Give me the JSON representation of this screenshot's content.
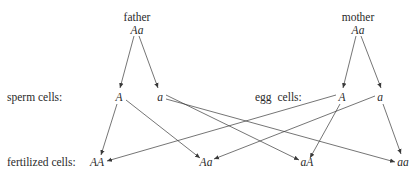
{
  "parents": {
    "father": {
      "label": "father",
      "genotype": "Aa"
    },
    "mother": {
      "label": "mother",
      "genotype": "Aa"
    }
  },
  "rows": {
    "sperm_label": "sperm cells:",
    "egg_label": "egg cells:",
    "fertilized_label": "fertilized cells:"
  },
  "gametes": {
    "sperm": [
      "A",
      "a"
    ],
    "egg": [
      "A",
      "a"
    ]
  },
  "offspring": [
    "AA",
    "Aa",
    "aA",
    "aa"
  ],
  "style": {
    "line_color": "#3a3a3a",
    "text_color": "#2a2a2a"
  }
}
